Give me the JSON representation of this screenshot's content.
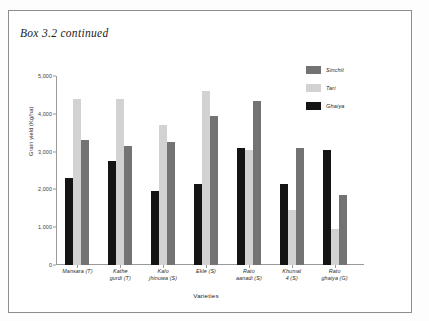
{
  "box": {
    "title": "Box 3.2 continued"
  },
  "legend": {
    "position": "top-right",
    "items": [
      {
        "label": "Sinchit",
        "color": "#737373",
        "key": "sinchit"
      },
      {
        "label": "Tari",
        "color": "#d2d2d2",
        "key": "tari"
      },
      {
        "label": "Ghaiya",
        "color": "#141414",
        "key": "ghaiya"
      }
    ]
  },
  "chart_data": {
    "type": "bar",
    "title": "",
    "xlabel": "Varieties",
    "ylabel": "Grain yield (Kg/ha)",
    "ylim": [
      0,
      5000
    ],
    "ytick_labels": [
      "5,000",
      "4,000",
      "3,000",
      "2,000",
      "1,000",
      "0"
    ],
    "ytick_values": [
      5000,
      4000,
      3000,
      2000,
      1000,
      0
    ],
    "grid": false,
    "legend_position": "top-right",
    "bar_order": [
      "Ghaiya",
      "Tari",
      "Sinchit"
    ],
    "categories": [
      "Mansara (T)",
      "Kathe gurdi (T)",
      "Kalo jhinuwa (S)",
      "Ekle (S)",
      "Rato aanadi (S)",
      "Khumal 4 (S)",
      "Rato ghaiya (G)"
    ],
    "categories_lines": [
      [
        "Mansara (T)"
      ],
      [
        "Kathe",
        "gurdi (T)"
      ],
      [
        "Kalo",
        "jhinuwa (S)"
      ],
      [
        "Ekle (S)"
      ],
      [
        "Rato",
        "aanadi (S)"
      ],
      [
        "Khumal",
        "4 (S)"
      ],
      [
        "Rato",
        "ghaiya (G)"
      ]
    ],
    "series": [
      {
        "name": "Ghaiya",
        "color": "#141414",
        "values": [
          2300,
          2750,
          1950,
          2150,
          3100,
          2150,
          3050
        ]
      },
      {
        "name": "Tari",
        "color": "#d2d2d2",
        "values": [
          4400,
          4400,
          3700,
          4600,
          3050,
          1450,
          950
        ]
      },
      {
        "name": "Sinchit",
        "color": "#737373",
        "values": [
          3300,
          3150,
          3250,
          3950,
          4350,
          3100,
          1850
        ]
      }
    ]
  }
}
